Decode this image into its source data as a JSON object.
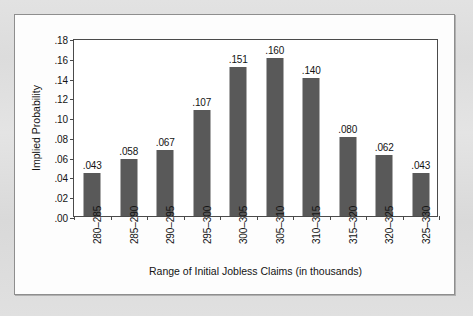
{
  "chart_data": {
    "type": "bar",
    "title": "",
    "xlabel": "Range of Initial Jobless Claims (in thousands)",
    "ylabel": "Implied Probability",
    "categories": [
      "280–285",
      "285–290",
      "290–295",
      "295–300",
      "300–305",
      "305–310",
      "310–315",
      "315–320",
      "320–325",
      "325–330"
    ],
    "values": [
      0.043,
      0.058,
      0.067,
      0.107,
      0.151,
      0.16,
      0.14,
      0.08,
      0.062,
      0.043
    ],
    "value_labels": [
      ".043",
      ".058",
      ".067",
      ".107",
      ".151",
      ".160",
      ".140",
      ".080",
      ".062",
      ".043"
    ],
    "ylim": [
      0.0,
      0.18
    ],
    "ytick_values": [
      0.18,
      0.16,
      0.14,
      0.12,
      0.1,
      0.08,
      0.06,
      0.04,
      0.02,
      0.0
    ],
    "ytick_labels": [
      ".18",
      ".16",
      ".14",
      ".12",
      ".10",
      ".08",
      ".06",
      ".04",
      ".02",
      ".00"
    ],
    "grid": false,
    "legend": false,
    "legend_position": "none",
    "bar_color": "#595959",
    "axis_color": "#4a4a4a",
    "plot_background": "#ffffff",
    "page_background": "#dedede"
  }
}
